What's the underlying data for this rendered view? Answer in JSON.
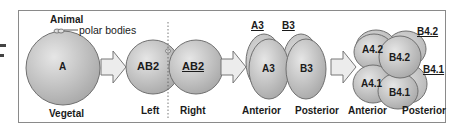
{
  "stage1": {
    "top_label": "Animal",
    "bottom_label": "Vegetal",
    "cell_label": "A",
    "annotation": "polar bodies"
  },
  "stage2": {
    "cells": [
      "AB2",
      "AB2"
    ],
    "left_label": "Left",
    "right_label": "Right"
  },
  "stage3": {
    "cells": [
      "A3",
      "B3"
    ],
    "back_labels": [
      "A3",
      "B3"
    ],
    "anterior_label": "Anterior",
    "posterior_label": "Posterior"
  },
  "stage4": {
    "cells": [
      "A4.2",
      "B4.2",
      "A4.1",
      "B4.1"
    ],
    "back_labels": [
      "B4.2",
      "B4.1"
    ],
    "anterior_label": "Anterior",
    "posterior_label": "Posterior"
  },
  "colors": {
    "cell_fill_light": "#e4e4e4",
    "cell_fill_dark": "#a8a8a8",
    "cell_stroke": "#6e6e6e",
    "arrow_fill": "#ececec",
    "frame": "#8a8a8a"
  }
}
